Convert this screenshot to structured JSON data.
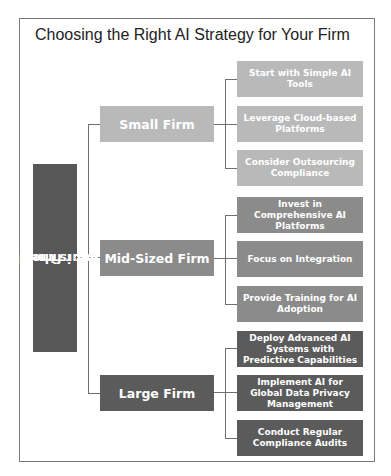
{
  "title": "Choosing the Right AI Strategy for Your Firm",
  "root": {
    "label": "What is the size of your firm?",
    "line1": "What is the size of",
    "line2": "your firm?",
    "color": "#575757"
  },
  "branches": [
    {
      "label": "Small Firm",
      "color": "#b9b9b9",
      "items": [
        "Start with Simple AI Tools",
        "Leverage Cloud-based Platforms",
        "Consider Outsourcing Compliance"
      ]
    },
    {
      "label": "Mid-Sized Firm",
      "color": "#8b8b8b",
      "items": [
        "Invest in Comprehensive AI Platforms",
        "Focus on Integration",
        "Provide Training for AI Adoption"
      ]
    },
    {
      "label": "Large Firm",
      "color": "#5b5b5b",
      "items": [
        "Deploy Advanced AI Systems with Predictive Capabilities",
        "Implement AI for Global Data Privacy Management",
        "Conduct Regular Compliance Audits"
      ]
    }
  ]
}
